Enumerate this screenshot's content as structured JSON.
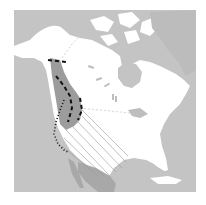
{
  "map": {
    "type": "species-range-map",
    "region": "North America",
    "colors": {
      "background": "#ffffff",
      "ocean": "#c4c4c4",
      "land": "#ffffff",
      "range_shade": "#9c9c9c",
      "mexico_shade": "#a8a8a8",
      "border": "#bdbdbd",
      "dash": "#111111",
      "hatch": "#999999"
    },
    "legend": [],
    "labels": []
  }
}
